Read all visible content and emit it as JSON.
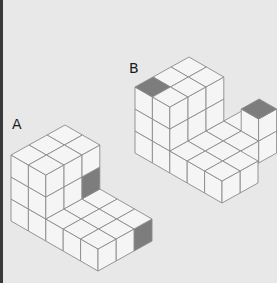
{
  "figure": {
    "background": "#e8e8e8",
    "face_fill": "#f5f5f5",
    "shaded_fill": "#7d7d7d",
    "line_color": "#8a8a8a",
    "projection": {
      "a_vec": [
        17.4,
        10
      ],
      "b_vec": [
        18,
        -10
      ],
      "z_vec": [
        0,
        -22
      ]
    }
  },
  "structures": [
    {
      "label": "A",
      "label_pos": [
        12,
        117
      ],
      "origin": [
        11,
        221
      ],
      "blocks": [
        {
          "a": [
            0,
            2
          ],
          "b": [
            0,
            3
          ],
          "z": [
            0,
            3
          ]
        },
        {
          "a": [
            2,
            5
          ],
          "b": [
            0,
            3
          ],
          "z": [
            0,
            1
          ]
        }
      ],
      "shaded_faces": [
        {
          "cell": [
            1,
            2,
            1
          ],
          "face": "right"
        },
        {
          "cell": [
            4,
            2,
            0
          ],
          "face": "right"
        }
      ]
    },
    {
      "label": "B",
      "label_pos": [
        129,
        61
      ],
      "origin": [
        135,
        153
      ],
      "blocks": [
        {
          "a": [
            0,
            2
          ],
          "b": [
            0,
            3
          ],
          "z": [
            0,
            3
          ]
        },
        {
          "a": [
            2,
            5
          ],
          "b": [
            0,
            2
          ],
          "z": [
            0,
            1
          ]
        },
        {
          "a": [
            2,
            4
          ],
          "b": [
            2,
            3
          ],
          "z": [
            0,
            1
          ]
        },
        {
          "a": [
            2,
            3
          ],
          "b": [
            3,
            4
          ],
          "z": [
            0,
            1
          ]
        },
        {
          "a": [
            3,
            4
          ],
          "b": [
            3,
            4
          ],
          "z": [
            0,
            2
          ]
        }
      ],
      "shaded_faces": [
        {
          "cell": [
            0,
            0,
            2
          ],
          "face": "top"
        },
        {
          "cell": [
            3,
            3,
            1
          ],
          "face": "top"
        }
      ]
    }
  ]
}
